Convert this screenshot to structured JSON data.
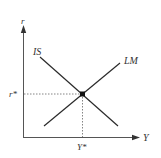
{
  "diagram": {
    "type": "IS-LM model",
    "axes": {
      "y_label": "r",
      "x_label": "Y"
    },
    "curves": [
      {
        "name": "IS",
        "label": "IS",
        "slope": "downward"
      },
      {
        "name": "LM",
        "label": "LM",
        "slope": "upward"
      }
    ],
    "equilibrium": {
      "r_label": "r*",
      "y_label": "Y*"
    },
    "colors": {
      "line": "#2a2a2a",
      "guide": "#666666",
      "text": "#333333"
    }
  }
}
